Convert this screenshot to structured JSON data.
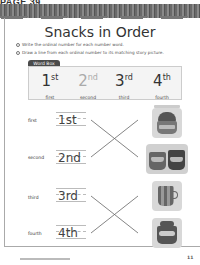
{
  "page": {
    "label": "PAGE 39",
    "title": "Snacks in Order",
    "instructions": [
      {
        "num": "1",
        "text": "Write the ordinal number for each number word."
      },
      {
        "num": "2",
        "text": "Draw a line from each ordinal number to its matching story picture."
      }
    ],
    "word_box": {
      "tag": "Word Box",
      "items": [
        {
          "num": "1",
          "suffix": "st",
          "word": "first"
        },
        {
          "num": "2",
          "suffix": "nd",
          "word": "second"
        },
        {
          "num": "3",
          "suffix": "rd",
          "word": "third"
        },
        {
          "num": "4",
          "suffix": "th",
          "word": "fourth"
        }
      ]
    },
    "rows": [
      {
        "word": "first",
        "answer": "1st"
      },
      {
        "word": "second",
        "answer": "2nd"
      },
      {
        "word": "third",
        "answer": "3rd"
      },
      {
        "word": "fourth",
        "answer": "4th"
      }
    ],
    "pictures": [
      {
        "name": "mug-with-cupcake-picture"
      },
      {
        "name": "two-mugs-picture"
      },
      {
        "name": "striped-mug-picture"
      },
      {
        "name": "mug-with-snack-picture"
      }
    ],
    "footer": {
      "page_number": "11"
    }
  }
}
